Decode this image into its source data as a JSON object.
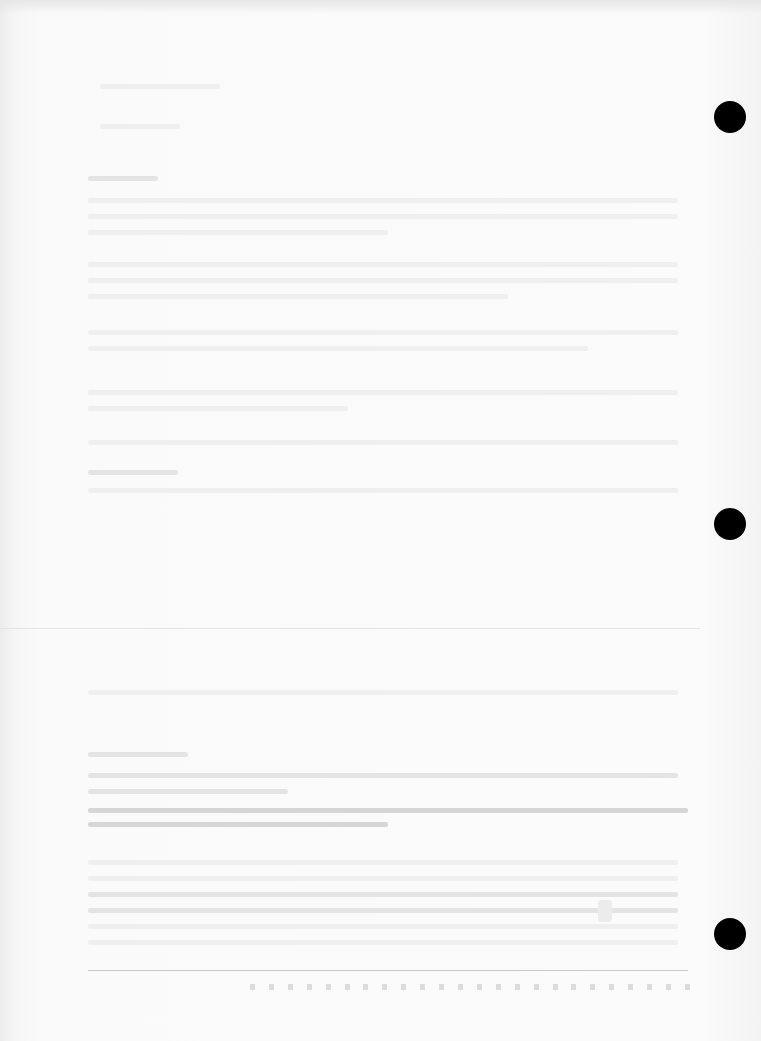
{
  "document": {
    "type": "scanned-page",
    "legibility": "text too faint to read",
    "binder_holes": 3,
    "colors": {
      "paper": "#fafafa",
      "hole": "#000000",
      "rule": "#c9c9c9"
    }
  }
}
